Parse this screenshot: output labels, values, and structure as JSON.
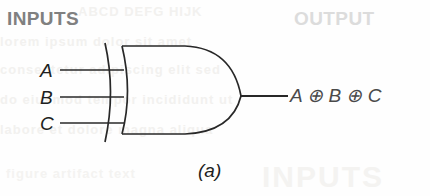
{
  "figure": {
    "caption": "(a)",
    "gate_type": "xor-gate",
    "line_color": "#282828",
    "heading_inputs_color": "#808080",
    "heading_output_color": "#dcdcdc"
  },
  "headings": {
    "inputs": "INPUTS",
    "output": "OUTPUT"
  },
  "inputs": {
    "pins": [
      {
        "label": "A",
        "y": 70
      },
      {
        "label": "B",
        "y": 97
      },
      {
        "label": "C",
        "y": 123
      }
    ]
  },
  "output": {
    "expression": "A ⊕ B ⊕ C",
    "y": 97
  },
  "bleed_through": {
    "fragments": [
      "ABCD  DEFG  HIJK",
      "lorem ipsum dolor sit amet",
      "consectetur adipiscing elit sed",
      "do eiusmod tempor incididunt ut",
      "labore et dolore magna aliqua",
      "INPUTS",
      "figure artifact text"
    ]
  }
}
